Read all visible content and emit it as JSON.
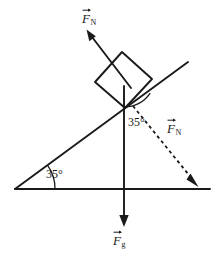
{
  "figure": {
    "background_color": "#ffffff",
    "stroke_color": "#1a1a1a",
    "width": 218,
    "height": 254
  },
  "labels": {
    "normal_force_top": {
      "symbol": "F",
      "subscript": "N",
      "full": "F_N",
      "description": "normal force vector label, solid arrow up-left"
    },
    "normal_force_dashed": {
      "symbol": "F",
      "subscript": "N",
      "full": "F_N",
      "description": "normal force component label, dashed arrow down-right"
    },
    "gravity_force": {
      "symbol": "F",
      "subscript": "g",
      "full": "F_g",
      "description": "gravitational force vector label, solid arrow down"
    },
    "incline_angle": {
      "value": "35",
      "unit": "°",
      "full": "35°",
      "description": "angle between incline surface and horizontal ground"
    },
    "block_angle": {
      "value": "35",
      "unit": "°",
      "full": "35°",
      "description": "angle between vertical weight line and dashed normal component"
    }
  },
  "geometry": {
    "ground_line": {
      "x1": 15,
      "y1": 189,
      "x2": 210,
      "y2": 189
    },
    "incline_line": {
      "x1": 15,
      "y1": 189,
      "x2": 188,
      "y2": 62
    },
    "block": {
      "corner_left": [
        95,
        82
      ],
      "corner_top": [
        122,
        52
      ],
      "corner_right": [
        152,
        79
      ],
      "corner_bottom": [
        125,
        108
      ]
    },
    "normal_arrow": {
      "tail": [
        131,
        88
      ],
      "tip": [
        87,
        31
      ]
    },
    "weight_arrow": {
      "tail": [
        124,
        86
      ],
      "tip": [
        124,
        226
      ]
    },
    "dashed_arrow": {
      "tail": [
        133,
        106
      ],
      "tip": [
        198,
        186
      ]
    },
    "incline_angle_arc_radius": 40,
    "block_angle_arc_radius": 32
  }
}
